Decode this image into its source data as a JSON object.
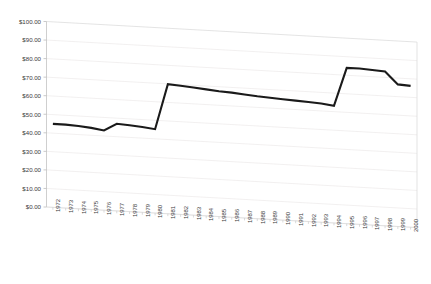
{
  "chart_data": {
    "type": "line",
    "title": "",
    "xlabel": "",
    "ylabel": "",
    "style": "excel-3d-line",
    "grid": true,
    "legend": "none",
    "ylim": [
      0,
      100
    ],
    "ytick_labels": [
      "$100.00",
      "$90.00",
      "$80.00",
      "$70.00",
      "$60.00",
      "$50.00",
      "$40.00",
      "$30.00",
      "$20.00",
      "$10.00",
      "$0.00"
    ],
    "ytick_values": [
      100,
      90,
      80,
      70,
      60,
      50,
      40,
      30,
      20,
      10,
      0
    ],
    "categories": [
      "1972",
      "1973",
      "1974",
      "1975",
      "1976",
      "1977",
      "1978",
      "1979",
      "1980",
      "1981",
      "1982",
      "1983",
      "1984",
      "1985",
      "1986",
      "1987",
      "1988",
      "1989",
      "1990",
      "1991",
      "1992",
      "1993",
      "1994",
      "1995",
      "1996",
      "1997",
      "1998",
      "1999",
      "2000"
    ],
    "series": [
      {
        "name": "Price",
        "color": "#1a1a1a",
        "values": [
          45.0,
          45.0,
          44.6,
          44.0,
          43.0,
          47.0,
          46.6,
          46.0,
          45.2,
          69.8,
          69.4,
          68.8,
          68.2,
          67.6,
          67.2,
          66.6,
          66.0,
          65.6,
          65.2,
          64.8,
          64.4,
          64.0,
          63.2,
          84.0,
          84.0,
          83.6,
          83.2,
          76.6,
          76.2
        ]
      }
    ]
  },
  "axis": {
    "y_title": "",
    "x_title": ""
  },
  "header": {
    "faint_title": ""
  }
}
